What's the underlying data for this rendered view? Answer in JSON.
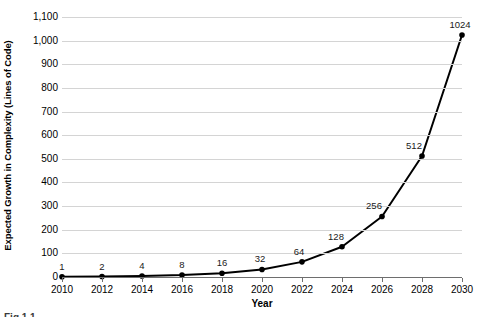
{
  "chart_data": {
    "type": "line",
    "title": "",
    "xlabel": "Year",
    "ylabel": "Expected Growth in Complexity (Lines of Code)",
    "x": [
      2010,
      2012,
      2014,
      2016,
      2018,
      2020,
      2022,
      2024,
      2026,
      2028,
      2030
    ],
    "values": [
      1,
      2,
      4,
      8,
      16,
      32,
      64,
      128,
      256,
      512,
      1024
    ],
    "point_labels": [
      "1",
      "2",
      "4",
      "8",
      "16",
      "32",
      "64",
      "128",
      "256",
      "512",
      "1024"
    ],
    "xtick_labels": [
      "2010",
      "2012",
      "2014",
      "2016",
      "2018",
      "2020",
      "2022",
      "2024",
      "2026",
      "2028",
      "2030"
    ],
    "ytick_labels": [
      "1,100",
      "1,000",
      "900",
      "800",
      "700",
      "600",
      "500",
      "400",
      "300",
      "200",
      "100",
      "0"
    ],
    "ytick_values": [
      1100,
      1000,
      900,
      800,
      700,
      600,
      500,
      400,
      300,
      200,
      100,
      0
    ],
    "xlim": [
      2010,
      2030
    ],
    "ylim": [
      0,
      1100
    ],
    "grid": true,
    "legend": false,
    "series_color": "#000000",
    "grid_color": "#d4d4d4",
    "axis_color": "#6e6e6e",
    "marker": "circle"
  },
  "caption": {
    "fragment": "Fig 1.1"
  }
}
